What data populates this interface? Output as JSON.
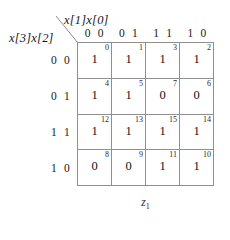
{
  "diagram": {
    "type": "karnaugh-map",
    "column_variables_label": "x[1]x[0]",
    "row_variables_label": "x[3]x[2]",
    "caption_symbol": "z",
    "caption_subscript": "1",
    "caption": "z1",
    "column_headers": [
      "0 0",
      "0 1",
      "1 1",
      "1 0"
    ],
    "row_headers": [
      "0 0",
      "0 1",
      "1 1",
      "1 0"
    ],
    "line_color": "#8f8f8f",
    "text_color": "#181818",
    "rows": [
      {
        "header": "0 0",
        "cells": [
          {
            "index": "0",
            "value": "1"
          },
          {
            "index": "1",
            "value": "1"
          },
          {
            "index": "3",
            "value": "1"
          },
          {
            "index": "2",
            "value": "1"
          }
        ]
      },
      {
        "header": "0 1",
        "cells": [
          {
            "index": "4",
            "value": "1"
          },
          {
            "index": "5",
            "value": "1"
          },
          {
            "index": "7",
            "value": "0"
          },
          {
            "index": "6",
            "value": "0"
          }
        ]
      },
      {
        "header": "1 1",
        "cells": [
          {
            "index": "12",
            "value": "1"
          },
          {
            "index": "13",
            "value": "1"
          },
          {
            "index": "15",
            "value": "1"
          },
          {
            "index": "14",
            "value": "1"
          }
        ]
      },
      {
        "header": "1 0",
        "cells": [
          {
            "index": "8",
            "value": "0"
          },
          {
            "index": "9",
            "value": "0"
          },
          {
            "index": "11",
            "value": "1"
          },
          {
            "index": "10",
            "value": "1"
          }
        ]
      }
    ]
  }
}
